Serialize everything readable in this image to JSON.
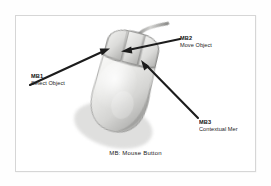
{
  "figure": {
    "background_color": "#ffffff",
    "frame_color": "#d6d6d6",
    "arrow_color": "#1c1c1c",
    "text_color": "#1a1a1a"
  },
  "device": {
    "name": "three-button-mouse",
    "body_color": "#d9d9d7",
    "highlight_color": "#f4f4f2",
    "shadow_color": "#8e8e8c",
    "buttons": [
      {
        "id": "MB1",
        "position": "left"
      },
      {
        "id": "MB2",
        "position": "middle"
      },
      {
        "id": "MB3",
        "position": "right"
      }
    ],
    "has_cable": true
  },
  "callouts": [
    {
      "tag": "MB1",
      "desc": "Select Object",
      "target_button": "left",
      "arrow_from": "lower-left"
    },
    {
      "tag": "MB2",
      "desc": "Move Object",
      "target_button": "middle",
      "arrow_from": "upper-right"
    },
    {
      "tag": "MB3",
      "desc": "Contextual Mer",
      "target_button": "right",
      "arrow_from": "lower-right"
    }
  ],
  "caption": {
    "text": "MB: Mouse Button"
  }
}
